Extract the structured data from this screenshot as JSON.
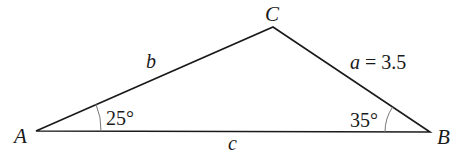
{
  "diagram": {
    "type": "triangle",
    "vertices": {
      "A": {
        "label": "A",
        "x": 36,
        "y": 131
      },
      "B": {
        "label": "B",
        "x": 430,
        "y": 132
      },
      "C": {
        "label": "C",
        "x": 273,
        "y": 27
      }
    },
    "sides": {
      "a": {
        "label": "a = 3.5",
        "var": "a",
        "value": "3.5"
      },
      "b": {
        "label": "b"
      },
      "c": {
        "label": "c"
      }
    },
    "angles": {
      "A": {
        "label": "25°"
      },
      "B": {
        "label": "35°"
      }
    },
    "colors": {
      "stroke": "#1a1a1a",
      "arc": "#777777",
      "background": "#ffffff"
    }
  }
}
